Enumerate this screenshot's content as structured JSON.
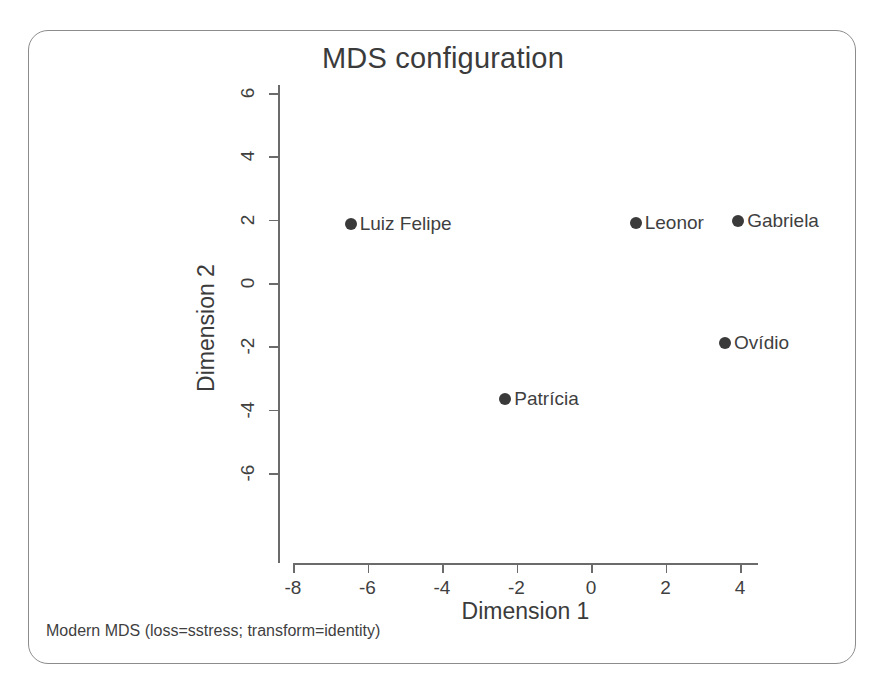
{
  "figure": {
    "title": "MDS configuration",
    "footnote": "Modern MDS (loss=sstress; transform=identity)"
  },
  "chart_data": {
    "type": "scatter",
    "title": "MDS configuration",
    "xlabel": "Dimension 1",
    "ylabel": "Dimension 2",
    "xlim": [
      -9,
      5
    ],
    "ylim": [
      -6.6,
      6.6
    ],
    "xticks": [
      -8,
      -6,
      -4,
      -2,
      0,
      2,
      4
    ],
    "yticks": [
      -6,
      -4,
      -2,
      0,
      2,
      4,
      6
    ],
    "xtick_labels": [
      "-8",
      "-6",
      "-4",
      "-2",
      "0",
      "2",
      "4"
    ],
    "ytick_labels": [
      "-6",
      "-4",
      "-2",
      "0",
      "2",
      "4",
      "6"
    ],
    "grid": false,
    "legend": false,
    "point_color": "#3a3a3a",
    "points": [
      {
        "label": "Luiz Felipe",
        "x": -6.45,
        "y": 1.85
      },
      {
        "label": "Leonor",
        "x": 1.2,
        "y": 1.9
      },
      {
        "label": "Gabriela",
        "x": 3.95,
        "y": 1.95
      },
      {
        "label": "Ovídio",
        "x": 3.6,
        "y": -1.9
      },
      {
        "label": "Patrícia",
        "x": -2.3,
        "y": -3.65
      }
    ],
    "annotation": "Modern MDS (loss=sstress; transform=identity)"
  }
}
